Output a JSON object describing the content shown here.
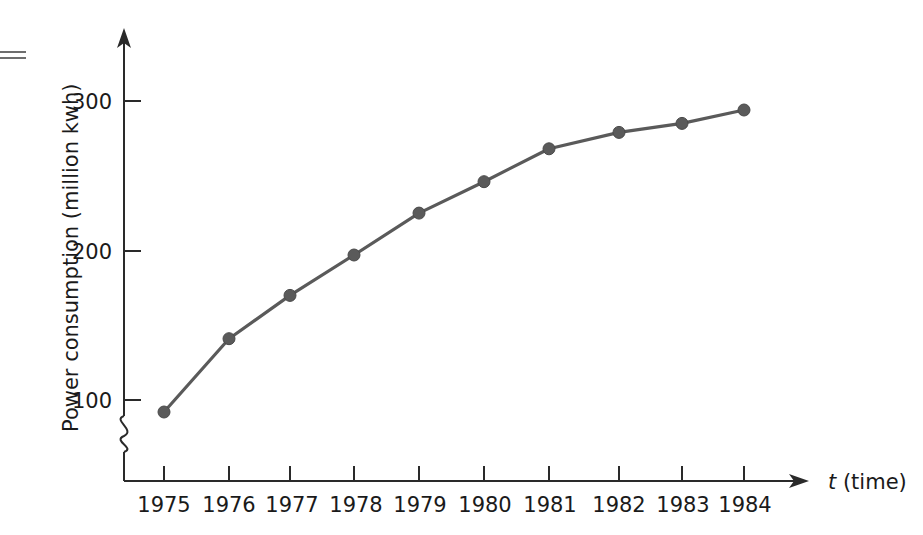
{
  "chart_data": {
    "type": "line",
    "title": "",
    "xlabel": "t (time)",
    "ylabel": "Power consumption (million kwh)",
    "categories": [
      "1975",
      "1976",
      "1977",
      "1978",
      "1979",
      "1980",
      "1981",
      "1982",
      "1983",
      "1984"
    ],
    "x": [
      1975,
      1976,
      1977,
      1978,
      1979,
      1980,
      1981,
      1982,
      1983,
      1984
    ],
    "values": [
      92,
      141,
      170,
      197,
      225,
      246,
      268,
      279,
      285,
      294
    ],
    "series": [
      {
        "name": "Power consumption",
        "values": [
          92,
          141,
          170,
          197,
          225,
          246,
          268,
          279,
          285,
          294
        ]
      }
    ],
    "ytick_labels": [
      "100",
      "200",
      "300"
    ],
    "yticks": [
      100,
      200,
      300
    ],
    "ylim": [
      60,
      330
    ],
    "xlim": [
      1974.4,
      1985.2
    ],
    "grid": false,
    "legend": "none",
    "axis_break": true,
    "marker": "filled-circle",
    "line_color": "#5a5a5a",
    "axis_color": "#2a2a2a"
  },
  "axes": {
    "y_label": "Power consumption (million kwh)",
    "x_label_var": "t",
    "x_label_rest": " (time)",
    "y_tick_1": "100",
    "y_tick_2": "200",
    "y_tick_3": "300",
    "x_tick_1": "1975",
    "x_tick_2": "1976",
    "x_tick_3": "1977",
    "x_tick_4": "1978",
    "x_tick_5": "1979",
    "x_tick_6": "1980",
    "x_tick_7": "1981",
    "x_tick_8": "1982",
    "x_tick_9": "1983",
    "x_tick_10": "1984"
  }
}
